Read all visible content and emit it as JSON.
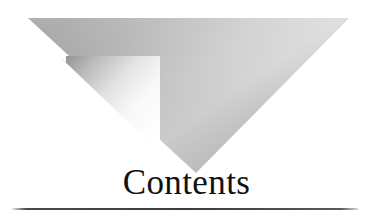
{
  "page": {
    "type": "book-contents-page-header",
    "background_color": "#ffffff",
    "width": 373,
    "height": 222
  },
  "heading": {
    "text": "Contents",
    "color": "#111111",
    "align": "center"
  },
  "rule": {
    "label": "horizontal-rule",
    "color": "#3c3c3c"
  },
  "ornament": {
    "label": "inverted-triangle-ornament",
    "outer_shape": "downward-pointing-triangle",
    "inner_shape": "notched-arrow-wedge",
    "outer_gradient_from": "#949494",
    "outer_gradient_to": "#dcdcdc",
    "inner_gradient_from": "#9e9e9e",
    "inner_gradient_to": "#ffffff",
    "apex_x": 196,
    "apex_y": 173,
    "top_left_x": 28,
    "top_right_x": 349,
    "top_y": 18
  }
}
